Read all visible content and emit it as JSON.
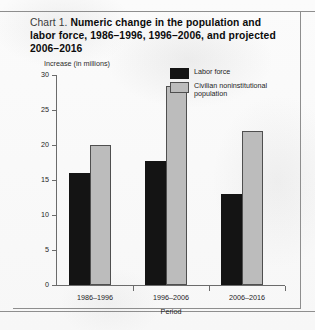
{
  "title": {
    "prefix": "Chart 1.",
    "main": "Numeric change in the population and labor force, 1986–1996, 1996–2006, and projected 2006–2016"
  },
  "chart_data": {
    "type": "bar",
    "title": "Chart 1. Numeric change in the population and labor force, 1986–1996, 1996–2006, and projected 2006–2016",
    "xlabel": "Period",
    "ylabel": "Increase (in millions)",
    "ylim": [
      0,
      30
    ],
    "yticks": [
      0,
      5,
      10,
      15,
      20,
      25,
      30
    ],
    "grid": false,
    "legend_position": "upper-right-inside",
    "categories": [
      "1986–1996",
      "1996–2006",
      "2006–2016"
    ],
    "series": [
      {
        "name": "Labor force",
        "color": "#141414",
        "values": [
          16.0,
          17.7,
          13.0
        ]
      },
      {
        "name": "Civilian noninstitutional population",
        "color": "#bcbcbc",
        "values": [
          20.0,
          28.4,
          22.0
        ]
      }
    ]
  }
}
